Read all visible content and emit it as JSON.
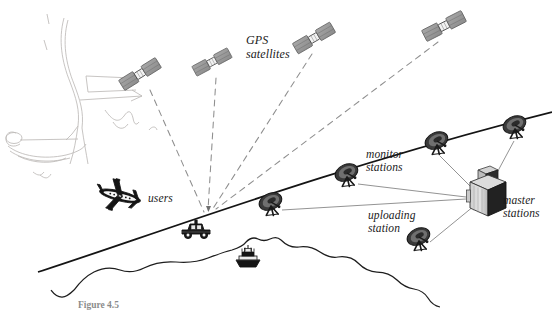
{
  "figure": {
    "caption": "Figure 4.5",
    "background_color": "#ffffff",
    "ink_color": "#1a1a1a",
    "satellite_fill": "#9a9a9a",
    "dashed_signal_color": "#8a8a8a",
    "link_line_color": "#8d8d8d",
    "sketch_color": "#b9b6b4"
  },
  "labels": {
    "gps_satellites": "GPS\nsatellites",
    "users": "users",
    "monitor_stations": "monitor\nstations",
    "master_stations": "master\nstations",
    "uploading_station": "uploading\nstation"
  },
  "satellites": [
    {
      "name": "satellite-1",
      "x": 140,
      "y": 74,
      "rotation": -32
    },
    {
      "name": "satellite-2",
      "x": 212,
      "y": 62,
      "rotation": -28
    },
    {
      "name": "satellite-3",
      "x": 314,
      "y": 38,
      "rotation": -30
    },
    {
      "name": "satellite-4",
      "x": 444,
      "y": 26,
      "rotation": -27
    }
  ],
  "ground_stations": [
    {
      "name": "monitor-station-left",
      "type": "dish",
      "x": 348,
      "y": 176
    },
    {
      "name": "monitor-station-mid",
      "type": "dish",
      "x": 272,
      "y": 205
    },
    {
      "name": "monitor-station-upper",
      "type": "dish",
      "x": 438,
      "y": 144
    },
    {
      "name": "monitor-station-right",
      "type": "dish",
      "x": 516,
      "y": 128
    },
    {
      "name": "uploading-station-dish",
      "type": "dish",
      "x": 420,
      "y": 240
    },
    {
      "name": "master-station-building",
      "type": "building",
      "x": 478,
      "y": 190
    }
  ],
  "users": [
    {
      "name": "user-aircraft",
      "x": 120,
      "y": 196
    },
    {
      "name": "user-vehicle",
      "x": 196,
      "y": 231
    },
    {
      "name": "user-ship",
      "x": 248,
      "y": 257
    }
  ],
  "icons": {
    "satellite": "satellite-icon",
    "dish": "parabolic-dish-icon",
    "building": "master-station-building-icon",
    "aircraft": "airplane-icon",
    "vehicle": "car-icon",
    "ship": "ship-icon"
  }
}
